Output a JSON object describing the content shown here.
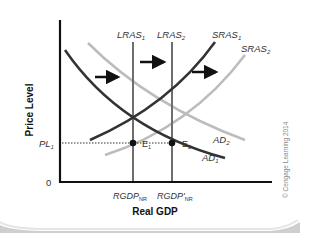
{
  "diagram": {
    "axes": {
      "x_label": "Real GDP",
      "y_label": "Price Level",
      "origin_label": "0"
    },
    "price_levels": [
      {
        "label_main": "PL",
        "label_sub": "1"
      }
    ],
    "x_ticks": [
      {
        "label_main": "RGDP",
        "label_sub": "NR"
      },
      {
        "label_main": "RGDP'",
        "label_sub": "NR"
      }
    ],
    "curves": {
      "lras1": {
        "main": "LRAS",
        "sub": "1",
        "color": "#6e6e6e"
      },
      "lras2": {
        "main": "LRAS",
        "sub": "2",
        "color": "#6e6e6e"
      },
      "sras1": {
        "main": "SRAS",
        "sub": "1",
        "color": "#333333"
      },
      "sras2": {
        "main": "SRAS",
        "sub": "2",
        "color": "#bcbcbc"
      },
      "ad1": {
        "main": "AD",
        "sub": "1",
        "color": "#333333"
      },
      "ad2": {
        "main": "AD",
        "sub": "2",
        "color": "#bcbcbc"
      }
    },
    "equilibria": [
      {
        "main": "E",
        "sub": "1"
      },
      {
        "main": "E",
        "sub": "2"
      }
    ],
    "shift_arrows": [
      "right",
      "right",
      "right"
    ],
    "credit": "© Cengage Learning 2014"
  }
}
